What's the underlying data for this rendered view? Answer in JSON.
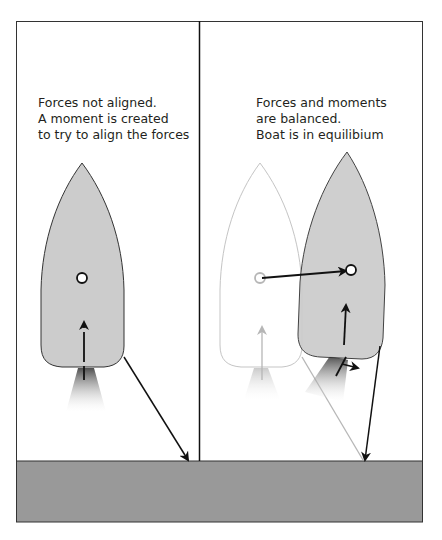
{
  "panels": {
    "left": {
      "caption_lines": [
        "Forces not aligned.",
        "A moment is created",
        "to try to align the forces"
      ],
      "state": "forces-not-aligned"
    },
    "right": {
      "caption_lines": [
        "Forces and moments",
        "are balanced.",
        "Boat is in equilibium"
      ],
      "state": "equilibrium"
    }
  },
  "colors": {
    "frame": "#333333",
    "ground": "#999999",
    "hull_fill": "#cccccc",
    "hull_stroke": "#333333",
    "ghost_stroke": "#bbbbbb",
    "arrow": "#111111",
    "ghost_arrow": "#aaaaaa",
    "thrust_plume_top": "#555555"
  },
  "elements": {
    "left_boat": {
      "bow_tip": [
        82,
        163
      ],
      "center_of_mass": [
        82,
        278
      ],
      "stern_y": 368
    },
    "ghost_boat": {
      "bow_tip": [
        260,
        163
      ],
      "center_of_mass": [
        260,
        278
      ]
    },
    "moved_boat": {
      "bow_tip": [
        347,
        152
      ],
      "center_of_mass": [
        351,
        270
      ]
    },
    "ground_top_y": 461
  }
}
